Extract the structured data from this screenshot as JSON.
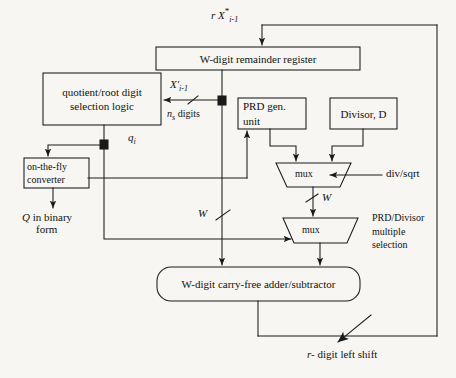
{
  "diagram": {
    "background_color": "#f7f6f2",
    "line_color": "#1a1a1a",
    "blocks": {
      "remainder_register": {
        "label": "W-digit remainder register",
        "label_italic_prefix": "W"
      },
      "selection_logic": {
        "line1": "quotient/root digit",
        "line2": "selection  logic"
      },
      "prd_gen": {
        "line1": "PRD gen.",
        "line2": "unit"
      },
      "divisor": {
        "label": "Divisor, D"
      },
      "converter": {
        "line1": "on-the-fly",
        "line2": "converter"
      },
      "adder": {
        "label": "W-digit carry-free adder/subtractor"
      },
      "mux_top": {
        "label": "mux"
      },
      "mux_bottom": {
        "label": "mux"
      }
    },
    "signals": {
      "input_top": {
        "base": "r X",
        "star": "*",
        "sub": "i-1"
      },
      "partial_remainder": {
        "base": "X'",
        "sub": "i-1"
      },
      "digits": {
        "n": "n",
        "sub": "s",
        "word": "digits"
      },
      "quotient_digit": {
        "base": "q",
        "sub": "i"
      },
      "converter_output": {
        "line1": "Q  in binary",
        "line2": "form"
      },
      "bus_w_left": "W",
      "bus_w_mux": "W",
      "div_sqrt": "div/sqrt",
      "multiple_selection": {
        "line1": "PRD/Divisor",
        "line2": "multiple",
        "line3": "selection"
      },
      "shift": {
        "prefix": "r-",
        "text": "digit left shift"
      }
    }
  }
}
